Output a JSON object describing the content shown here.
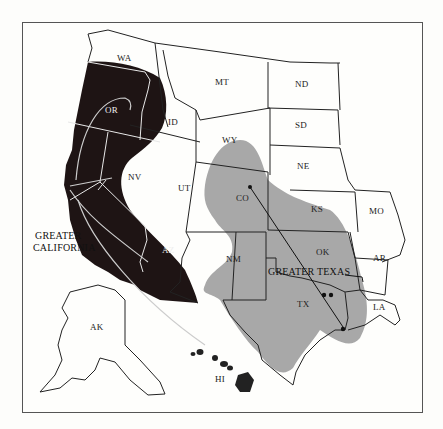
{
  "map": {
    "title": "Greater California and Greater Texas",
    "regions": [
      {
        "name": "GREATER CALIFORNIA",
        "line1": "GREATER",
        "line2": "CALIFORNIA",
        "color": "#1e1414"
      },
      {
        "name": "GREATER TEXAS",
        "color": "#a6a6a6"
      }
    ],
    "states": {
      "WA": "WA",
      "OR": "OR",
      "ID": "ID",
      "MT": "MT",
      "ND": "ND",
      "SD": "SD",
      "WY": "WY",
      "NV": "NV",
      "UT": "UT",
      "CO": "CO",
      "NE": "NE",
      "KS": "KS",
      "MO": "MO",
      "AZ": "AZ",
      "NM": "NM",
      "OK": "OK",
      "AR": "AR",
      "TX": "TX",
      "LA": "LA",
      "AK": "AK",
      "HI": "HI"
    },
    "labels": {
      "greater_california_1": "GREATER",
      "greater_california_2": "CALIFORNIA",
      "greater_texas": "GREATER TEXAS"
    },
    "colors": {
      "california_fill": "#1e1414",
      "texas_fill": "#a6a6a6",
      "border": "#222222",
      "background": "#fefefc"
    }
  }
}
